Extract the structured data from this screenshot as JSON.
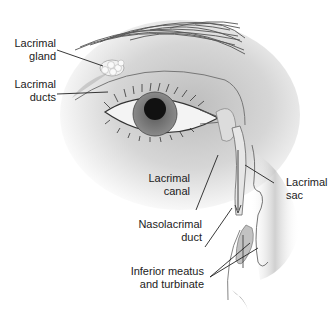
{
  "diagram": {
    "labels": [
      {
        "id": "lacrimal-gland",
        "lines": [
          "Lacrimal",
          "gland"
        ]
      },
      {
        "id": "lacrimal-ducts",
        "lines": [
          "Lacrimal",
          "ducts"
        ]
      },
      {
        "id": "lacrimal-sac",
        "lines": [
          "Lacrimal",
          "sac"
        ]
      },
      {
        "id": "lacrimal-canal",
        "lines": [
          "Lacrimal",
          "canal"
        ]
      },
      {
        "id": "nasolacrimal-duct",
        "lines": [
          "Nasolacrimal",
          "duct"
        ]
      },
      {
        "id": "inferior-meatus",
        "lines": [
          "Inferior meatus",
          "and turbinate"
        ]
      }
    ]
  }
}
